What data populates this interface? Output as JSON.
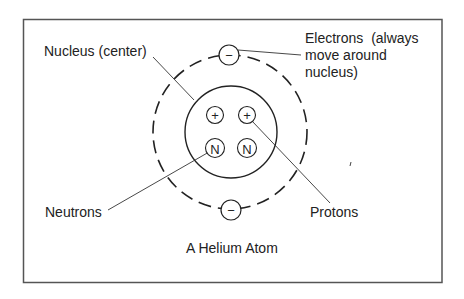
{
  "diagram": {
    "title": "A Helium Atom",
    "labels": {
      "nucleus": "Nucleus (center)",
      "electrons": [
        "Electrons  (always",
        "move around",
        "nucleus)"
      ],
      "neutrons": "Neutrons",
      "protons": "Protons"
    },
    "particles": {
      "electron_symbol": "−",
      "proton_symbol": "+",
      "neutron_symbol": "N"
    },
    "colors": {
      "stroke": "#222222",
      "frame": "#555555",
      "background": "#ffffff"
    }
  }
}
